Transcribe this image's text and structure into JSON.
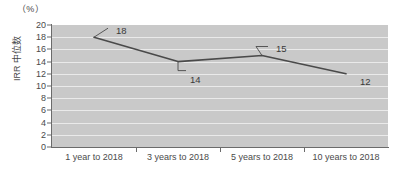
{
  "chart_data": {
    "type": "line",
    "title": "",
    "subtitle": "",
    "unit_label": "（%）",
    "xlabel": "",
    "ylabel": "IRR 中位数",
    "categories": [
      "1 year to 2018",
      "3 years to 2018",
      "5 years to 2018",
      "10 years to 2018"
    ],
    "values": [
      18,
      14,
      15,
      12
    ],
    "point_labels": [
      "18",
      "14",
      "15",
      "12"
    ],
    "ylim": [
      0,
      20
    ],
    "yticks": [
      "0",
      "2",
      "4",
      "6",
      "8",
      "10",
      "12",
      "14",
      "16",
      "18",
      "20"
    ],
    "grid": true,
    "grid_orientation": "horizontal",
    "legend": "none",
    "series": [
      {
        "name": "IRR 中位数",
        "values": [
          18,
          14,
          15,
          12
        ]
      }
    ],
    "colors": {
      "line": "#4a4a4a",
      "plot_background": "#c9c9c9",
      "gridline": "#eaeaea",
      "axis": "#6b6b6b",
      "text": "#4a4a4a",
      "page_background": "#ffffff"
    }
  }
}
